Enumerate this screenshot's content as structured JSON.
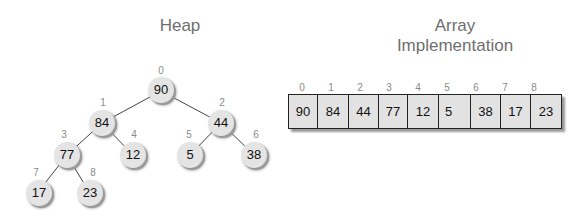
{
  "heap": {
    "title": "Heap",
    "nodes": [
      {
        "index": "0",
        "value": "90"
      },
      {
        "index": "1",
        "value": "84"
      },
      {
        "index": "2",
        "value": "44"
      },
      {
        "index": "3",
        "value": "77"
      },
      {
        "index": "4",
        "value": "12"
      },
      {
        "index": "5",
        "value": "5"
      },
      {
        "index": "6",
        "value": "38"
      },
      {
        "index": "7",
        "value": "17"
      },
      {
        "index": "8",
        "value": "23"
      }
    ]
  },
  "array": {
    "title_line1": "Array",
    "title_line2": "Implementation",
    "indices": [
      "0",
      "1",
      "2",
      "3",
      "4",
      "5",
      "6",
      "7",
      "8"
    ],
    "values": [
      "90",
      "84",
      "44",
      "77",
      "12",
      "5",
      "38",
      "17",
      "23"
    ]
  },
  "colors": {
    "node_fill": "#e4e4e4",
    "cell_fill": "#e2e2e2",
    "title_text": "#6f6f6f",
    "index_text": "#8a8a8a"
  }
}
